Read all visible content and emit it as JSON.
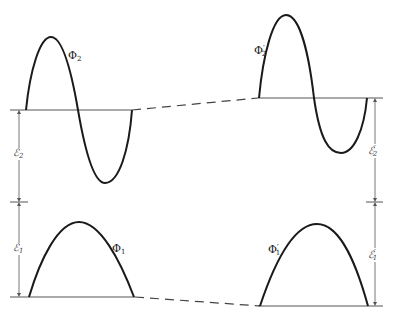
{
  "diagram": {
    "type": "energy-level-wavefunction-comparison",
    "left": {
      "wave_upper": {
        "symbol": "Φ",
        "subscript": "2",
        "prime": ""
      },
      "wave_lower": {
        "symbol": "Φ",
        "subscript": "1",
        "prime": ""
      },
      "energy_upper": {
        "symbol": "ℰ",
        "subscript": "2",
        "prime": ""
      },
      "energy_lower": {
        "symbol": "ℰ",
        "subscript": "1",
        "prime": ""
      }
    },
    "right": {
      "wave_upper": {
        "symbol": "Φ",
        "subscript": "2",
        "prime": "′"
      },
      "wave_lower": {
        "symbol": "Φ",
        "subscript": "1",
        "prime": "′"
      },
      "energy_upper": {
        "symbol": "ℰ",
        "subscript": "2",
        "prime": "′"
      },
      "energy_lower": {
        "symbol": "ℰ",
        "subscript": "1",
        "prime": "′"
      }
    },
    "colors": {
      "curve": "#1a1a1a",
      "line": "#555555",
      "dash": "#444444"
    }
  }
}
